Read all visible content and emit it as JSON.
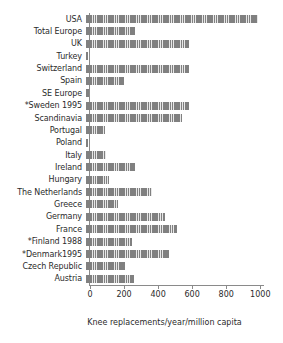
{
  "chart_data": {
    "type": "bar",
    "orientation": "horizontal",
    "title": "",
    "xlabel": "Knee replacements/year/million capita",
    "ylabel": "",
    "xlim": [
      0,
      1010
    ],
    "xticks": [
      0,
      200,
      400,
      600,
      800,
      1000
    ],
    "xtick_labels": [
      "0",
      "200",
      "400",
      "600",
      "800",
      "1000"
    ],
    "grid": false,
    "legend": null,
    "bar_color": "#808080",
    "categories": [
      "USA",
      "Total Europe",
      "UK",
      "Turkey",
      "Switzerland",
      "Spain",
      "SE Europe",
      "*Sweden 1995",
      "Scandinavia",
      "Portugal",
      "Poland",
      "Italy",
      "Ireland",
      "Hungary",
      "The Netherlands",
      "Greece",
      "Germany",
      "France",
      "*Finland 1988",
      "*Denmark1995",
      "Czech Republic",
      "Austria"
    ],
    "values": [
      1010,
      285,
      605,
      12,
      605,
      225,
      18,
      605,
      565,
      110,
      14,
      120,
      285,
      135,
      390,
      185,
      465,
      535,
      270,
      485,
      230,
      280
    ]
  }
}
